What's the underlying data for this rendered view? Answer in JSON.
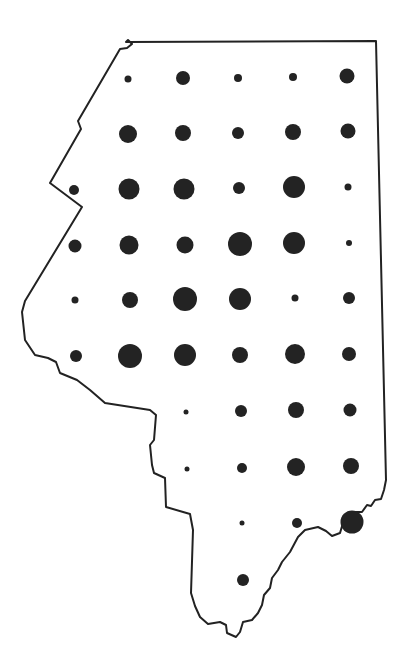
{
  "map": {
    "type": "proportional-dot-map",
    "background": "#ffffff",
    "outline_color": "#222222",
    "dot_color": "#232323",
    "outline_path": "M126,42 L128,40 L132,44 L127,48 L120,49 L78,121 L81,129 L50,183 L82,207 L25,301 L22,312 L25,340 L35,355 L48,358 L56,362 L60,373 L77,380 L90,390 L105,403 L150,410 L156,415 L154,440 L150,445 L152,465 L154,473 L165,478 L166,507 L190,514 L193,530 L191,593 L195,606 L200,617 L208,624 L220,622 L226,625 L227,633 L236,637 L240,632 L243,622 L252,620 L258,613 L262,605 L264,595 L270,588 L272,578 L278,570 L282,562 L290,552 L298,537 L305,530 L318,527 L326,531 L332,536 L340,533 L343,523 L350,517 L355,512 L362,512 L367,505 L371,506 L375,500 L381,499 L384,490 L386,480 L376,41 Z",
    "grid": {
      "columns_x": [
        74,
        128,
        184,
        238,
        293,
        348
      ],
      "rows_y": [
        78,
        132,
        188,
        242,
        298,
        354,
        410,
        466,
        520,
        578
      ]
    },
    "dots": [
      {
        "row": 0,
        "col": 1,
        "x": 128,
        "y": 79,
        "r": 3.5
      },
      {
        "row": 0,
        "col": 2,
        "x": 183,
        "y": 78,
        "r": 7
      },
      {
        "row": 0,
        "col": 3,
        "x": 238,
        "y": 78,
        "r": 4
      },
      {
        "row": 0,
        "col": 4,
        "x": 293,
        "y": 77,
        "r": 4
      },
      {
        "row": 0,
        "col": 5,
        "x": 347,
        "y": 76,
        "r": 7.5
      },
      {
        "row": 1,
        "col": 1,
        "x": 128,
        "y": 134,
        "r": 9
      },
      {
        "row": 1,
        "col": 2,
        "x": 183,
        "y": 133,
        "r": 8
      },
      {
        "row": 1,
        "col": 3,
        "x": 238,
        "y": 133,
        "r": 6
      },
      {
        "row": 1,
        "col": 4,
        "x": 293,
        "y": 132,
        "r": 8
      },
      {
        "row": 1,
        "col": 5,
        "x": 348,
        "y": 131,
        "r": 7.5
      },
      {
        "row": 2,
        "col": 0,
        "x": 74,
        "y": 190,
        "r": 5
      },
      {
        "row": 2,
        "col": 1,
        "x": 129,
        "y": 189,
        "r": 10.5
      },
      {
        "row": 2,
        "col": 2,
        "x": 184,
        "y": 189,
        "r": 10.5
      },
      {
        "row": 2,
        "col": 3,
        "x": 239,
        "y": 188,
        "r": 6
      },
      {
        "row": 2,
        "col": 4,
        "x": 294,
        "y": 187,
        "r": 11
      },
      {
        "row": 2,
        "col": 5,
        "x": 348,
        "y": 187,
        "r": 3.5
      },
      {
        "row": 3,
        "col": 0,
        "x": 75,
        "y": 246,
        "r": 6.5
      },
      {
        "row": 3,
        "col": 1,
        "x": 129,
        "y": 245,
        "r": 9.5
      },
      {
        "row": 3,
        "col": 2,
        "x": 185,
        "y": 245,
        "r": 8.5
      },
      {
        "row": 3,
        "col": 3,
        "x": 240,
        "y": 244,
        "r": 12
      },
      {
        "row": 3,
        "col": 4,
        "x": 294,
        "y": 243,
        "r": 11
      },
      {
        "row": 3,
        "col": 5,
        "x": 349,
        "y": 243,
        "r": 3
      },
      {
        "row": 4,
        "col": 0,
        "x": 75,
        "y": 300,
        "r": 3.5
      },
      {
        "row": 4,
        "col": 1,
        "x": 130,
        "y": 300,
        "r": 8
      },
      {
        "row": 4,
        "col": 2,
        "x": 185,
        "y": 299,
        "r": 12
      },
      {
        "row": 4,
        "col": 3,
        "x": 240,
        "y": 299,
        "r": 11
      },
      {
        "row": 4,
        "col": 4,
        "x": 295,
        "y": 298,
        "r": 3.5
      },
      {
        "row": 4,
        "col": 5,
        "x": 349,
        "y": 298,
        "r": 6
      },
      {
        "row": 5,
        "col": 0,
        "x": 76,
        "y": 356,
        "r": 6
      },
      {
        "row": 5,
        "col": 1,
        "x": 130,
        "y": 356,
        "r": 12
      },
      {
        "row": 5,
        "col": 2,
        "x": 185,
        "y": 355,
        "r": 11
      },
      {
        "row": 5,
        "col": 3,
        "x": 240,
        "y": 355,
        "r": 8
      },
      {
        "row": 5,
        "col": 4,
        "x": 295,
        "y": 354,
        "r": 10
      },
      {
        "row": 5,
        "col": 5,
        "x": 349,
        "y": 354,
        "r": 7
      },
      {
        "row": 6,
        "col": 2,
        "x": 186,
        "y": 412,
        "r": 2.5
      },
      {
        "row": 6,
        "col": 3,
        "x": 241,
        "y": 411,
        "r": 6
      },
      {
        "row": 6,
        "col": 4,
        "x": 296,
        "y": 410,
        "r": 8
      },
      {
        "row": 6,
        "col": 5,
        "x": 350,
        "y": 410,
        "r": 6.5
      },
      {
        "row": 7,
        "col": 2,
        "x": 187,
        "y": 469,
        "r": 2.5
      },
      {
        "row": 7,
        "col": 3,
        "x": 242,
        "y": 468,
        "r": 5
      },
      {
        "row": 7,
        "col": 4,
        "x": 296,
        "y": 467,
        "r": 9
      },
      {
        "row": 7,
        "col": 5,
        "x": 351,
        "y": 466,
        "r": 8
      },
      {
        "row": 8,
        "col": 3,
        "x": 242,
        "y": 523,
        "r": 2.5
      },
      {
        "row": 8,
        "col": 4,
        "x": 297,
        "y": 523,
        "r": 5
      },
      {
        "row": 8,
        "col": 5,
        "x": 352,
        "y": 522,
        "r": 11.5
      },
      {
        "row": 9,
        "col": 3,
        "x": 243,
        "y": 580,
        "r": 6
      }
    ]
  }
}
